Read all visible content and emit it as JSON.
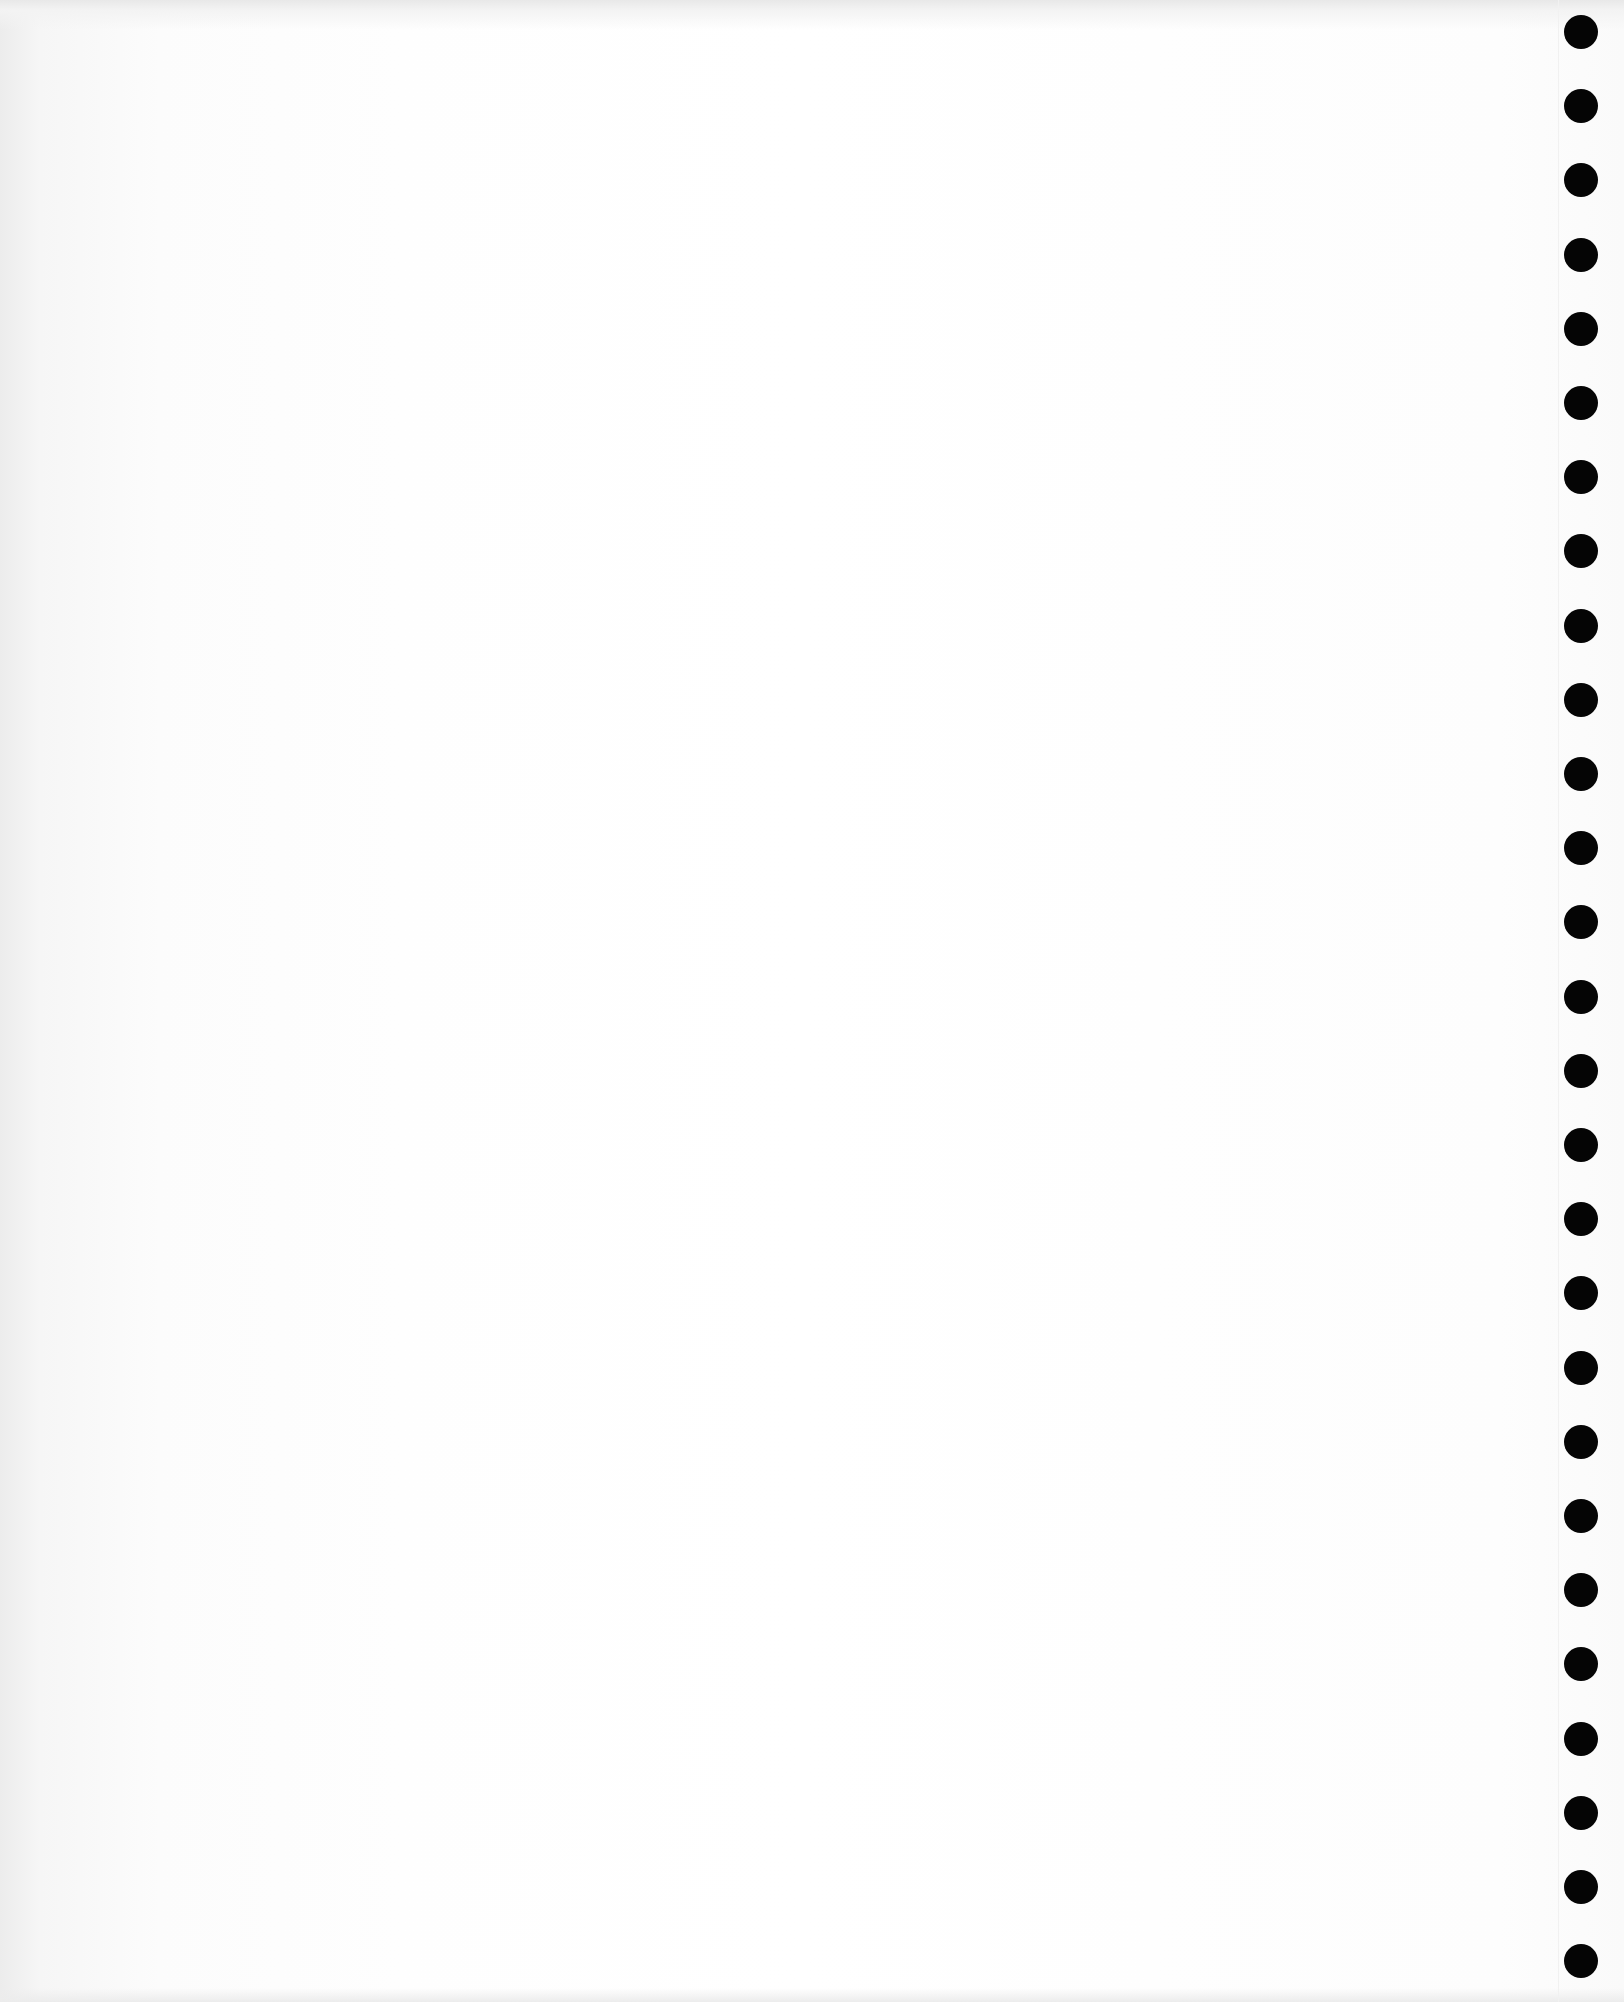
{
  "page": {
    "type": "continuous-feed paper sheet",
    "content": "",
    "background_color": "#fdfdfd"
  },
  "feed_holes": {
    "count": 27,
    "color": "#050505",
    "diameter_px": 34,
    "first_center_y": 32,
    "spacing_px": 74.2,
    "center_x": 1581
  }
}
